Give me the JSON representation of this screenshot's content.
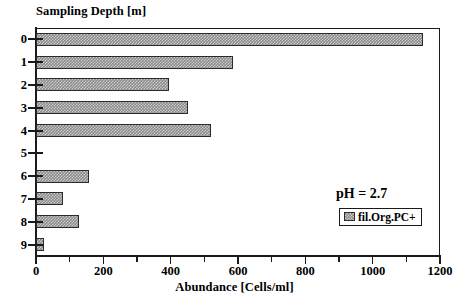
{
  "chart_data": {
    "type": "bar",
    "orientation": "horizontal",
    "title": "",
    "ylabel": "Sampling Depth [m]",
    "xlabel": "Abundance [Cells/ml]",
    "categories": [
      "0",
      "1",
      "2",
      "3",
      "4",
      "5",
      "6",
      "7",
      "8",
      "9"
    ],
    "series": [
      {
        "name": "fil.Org.PC+",
        "values": [
          1150,
          585,
          395,
          450,
          520,
          0,
          157,
          80,
          127,
          25
        ]
      }
    ],
    "xlim": [
      0,
      1200
    ],
    "xticks": [
      0,
      200,
      400,
      600,
      800,
      1000,
      1200
    ],
    "xtick_labels": [
      "0",
      "200",
      "400",
      "600",
      "800",
      "1000",
      "1200"
    ],
    "xminor_step": 100,
    "grid": false,
    "legend": {
      "position": "inside-right",
      "entries": [
        "fil.Org.PC+"
      ]
    },
    "annotations": [
      {
        "text": "pH = 2.7"
      }
    ],
    "colors": {
      "bar_fill": "#8a8a8a",
      "bar_edge": "#2b2b2b",
      "axis": "#1a1a1a",
      "background": "#ffffff"
    }
  },
  "axes": {
    "y_title": "Sampling Depth [m]",
    "x_title": "Abundance [Cells/ml]"
  },
  "legend": {
    "entry_label": "fil.Org.PC+"
  },
  "annotation": {
    "ph_text": "pH = 2.7"
  }
}
